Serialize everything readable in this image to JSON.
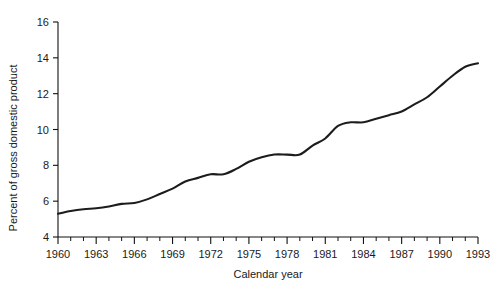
{
  "chart_data": {
    "type": "line",
    "title": "",
    "subtitle": "",
    "xlabel": "Calendar year",
    "ylabel": "Percent of gross domestic product",
    "xlim": [
      1960,
      1993
    ],
    "ylim": [
      4,
      16
    ],
    "grid": false,
    "legend": null,
    "legend_position": "none",
    "x_tick_labels": [
      "1960",
      "1963",
      "1966",
      "1969",
      "1972",
      "1975",
      "1978",
      "1981",
      "1984",
      "1987",
      "1990",
      "1993"
    ],
    "x_tick_values": [
      1960,
      1963,
      1966,
      1969,
      1972,
      1975,
      1978,
      1981,
      1984,
      1987,
      1990,
      1993
    ],
    "x_minor_tick_step": 1,
    "y_tick_labels": [
      "4",
      "6",
      "8",
      "10",
      "12",
      "14",
      "16"
    ],
    "y_tick_values": [
      4,
      6,
      8,
      10,
      12,
      14,
      16
    ],
    "line_color": "#1c1c1c",
    "x": [
      1960,
      1961,
      1962,
      1963,
      1964,
      1965,
      1966,
      1967,
      1968,
      1969,
      1970,
      1971,
      1972,
      1973,
      1974,
      1975,
      1976,
      1977,
      1978,
      1979,
      1980,
      1981,
      1982,
      1983,
      1984,
      1985,
      1986,
      1987,
      1988,
      1989,
      1990,
      1991,
      1992,
      1993
    ],
    "values": [
      5.3,
      5.45,
      5.55,
      5.6,
      5.7,
      5.85,
      5.9,
      6.1,
      6.4,
      6.7,
      7.1,
      7.3,
      7.5,
      7.5,
      7.8,
      8.2,
      8.45,
      8.6,
      8.6,
      8.6,
      9.1,
      9.5,
      10.2,
      10.4,
      10.4,
      10.6,
      10.8,
      11.0,
      11.4,
      11.8,
      12.4,
      13.0,
      13.5,
      13.7
    ],
    "series": [
      {
        "name": "National health expenditures",
        "values": [
          5.3,
          5.45,
          5.55,
          5.6,
          5.7,
          5.85,
          5.9,
          6.1,
          6.4,
          6.7,
          7.1,
          7.3,
          7.5,
          7.5,
          7.8,
          8.2,
          8.45,
          8.6,
          8.6,
          8.6,
          9.1,
          9.5,
          10.2,
          10.4,
          10.4,
          10.6,
          10.8,
          11.0,
          11.4,
          11.8,
          12.4,
          13.0,
          13.5,
          13.7
        ]
      }
    ],
    "annotations": []
  }
}
